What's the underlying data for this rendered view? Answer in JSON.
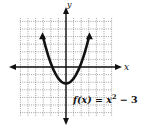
{
  "chart_data": {
    "type": "line",
    "title": "",
    "function_label": "f(x) = x² − 3",
    "xlabel": "x",
    "ylabel": "y",
    "xlim": [
      -6,
      6
    ],
    "ylim": [
      -5,
      6
    ],
    "grid": true,
    "grid_style": "dotted",
    "series": [
      {
        "name": "f(x) = x^2 - 3",
        "x": [
          -3,
          -2.5,
          -2,
          -1.5,
          -1,
          -0.5,
          0,
          0.5,
          1,
          1.5,
          2,
          2.5,
          3
        ],
        "y": [
          6,
          3.25,
          1,
          -0.75,
          -2,
          -2.75,
          -3,
          -2.75,
          -2,
          -0.75,
          1,
          3.25,
          6
        ]
      }
    ],
    "vertex": [
      0,
      -3
    ]
  },
  "labels": {
    "x_axis": "x",
    "y_axis": "y",
    "equation_prefix": "f(x) = x",
    "equation_exp": "2",
    "equation_suffix": " − 3"
  },
  "colors": {
    "curve": "#111111",
    "axes": "#111111",
    "grid": "#555555"
  }
}
